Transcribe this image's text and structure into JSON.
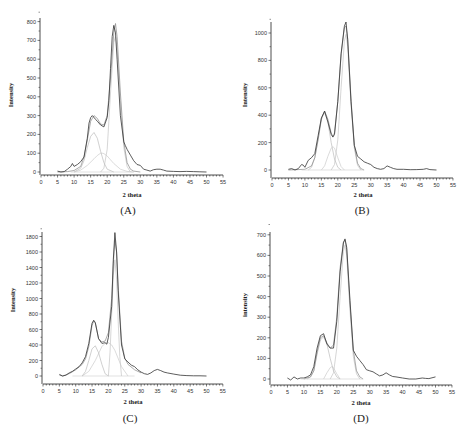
{
  "figure": {
    "panels": [
      "A",
      "B",
      "C",
      "D"
    ]
  },
  "chart_data": [
    {
      "type": "line",
      "panel_label": "(A)",
      "title": "",
      "xlabel": "2 theta",
      "ylabel": "Intensity",
      "xlim": [
        0,
        55
      ],
      "ylim": [
        -20,
        810
      ],
      "xticks": [
        0,
        5,
        10,
        15,
        20,
        25,
        30,
        35,
        40,
        45,
        50,
        55
      ],
      "yticks": [
        0,
        100,
        200,
        300,
        400,
        500,
        600,
        700,
        800
      ],
      "grid": false,
      "legend": null,
      "series": [
        {
          "name": "experimental",
          "color": "#333333",
          "x": [
            5,
            6,
            7,
            8,
            9,
            9.5,
            10,
            11,
            12,
            13,
            14,
            14.5,
            15,
            15.5,
            16,
            16.5,
            17,
            18,
            19,
            20,
            20.5,
            21,
            21.5,
            22,
            22.5,
            23,
            24,
            25,
            25.5,
            26,
            27,
            28,
            29,
            30,
            31,
            32,
            33,
            34,
            35,
            36,
            37,
            38,
            40,
            42,
            44,
            46,
            48,
            50
          ],
          "y": [
            5,
            0,
            2,
            15,
            30,
            45,
            30,
            40,
            55,
            80,
            180,
            260,
            290,
            300,
            290,
            280,
            270,
            250,
            240,
            290,
            380,
            550,
            720,
            780,
            740,
            600,
            300,
            160,
            140,
            120,
            90,
            60,
            40,
            35,
            15,
            10,
            5,
            12,
            15,
            15,
            10,
            5,
            3,
            2,
            3,
            2,
            1,
            0
          ]
        },
        {
          "name": "fit",
          "color": "#888888",
          "x": [
            5,
            8,
            10,
            12,
            13,
            14,
            15,
            16,
            17,
            18,
            19,
            20,
            21,
            22,
            22.5,
            23,
            24,
            25,
            26,
            27,
            28,
            30
          ],
          "y": [
            0,
            2,
            8,
            30,
            80,
            170,
            270,
            300,
            285,
            255,
            250,
            300,
            500,
            740,
            790,
            720,
            420,
            160,
            50,
            15,
            5,
            0
          ]
        },
        {
          "name": "component peak 1 (~16)",
          "color": "#bbbbbb",
          "x": [
            10,
            12,
            13,
            14,
            15,
            16,
            17,
            18,
            19,
            20,
            22
          ],
          "y": [
            0,
            20,
            60,
            130,
            190,
            210,
            180,
            110,
            50,
            15,
            0
          ]
        },
        {
          "name": "component peak 2 (~18.5)",
          "color": "#cccccc",
          "x": [
            10,
            12,
            14,
            16,
            17,
            18,
            18.5,
            19,
            20,
            21,
            22,
            24,
            26,
            28
          ],
          "y": [
            0,
            10,
            35,
            70,
            88,
            100,
            100,
            98,
            85,
            65,
            45,
            15,
            3,
            0
          ]
        },
        {
          "name": "component peak 3 (~22.5)",
          "color": "#c4c4c4",
          "x": [
            18,
            19,
            20,
            21,
            22,
            22.5,
            23,
            24,
            25,
            26,
            27
          ],
          "y": [
            0,
            20,
            120,
            420,
            690,
            720,
            660,
            380,
            130,
            30,
            0
          ]
        }
      ]
    },
    {
      "type": "line",
      "panel_label": "(B)",
      "title": "",
      "xlabel": "2 theta",
      "ylabel": "Intensity",
      "xlim": [
        0,
        55
      ],
      "ylim": [
        -40,
        1090
      ],
      "xticks": [
        0,
        5,
        10,
        15,
        20,
        25,
        30,
        35,
        40,
        45,
        50,
        55
      ],
      "yticks": [
        0,
        200,
        400,
        600,
        800,
        1000
      ],
      "grid": false,
      "legend": null,
      "series": [
        {
          "name": "experimental",
          "color": "#333333",
          "x": [
            5,
            6,
            7,
            8,
            9,
            9.5,
            10,
            11,
            12,
            13,
            14,
            15,
            16,
            17,
            18,
            18.5,
            19,
            20,
            21,
            22,
            22.5,
            23,
            24,
            25,
            26,
            27,
            28,
            29,
            30,
            31,
            32,
            33,
            34,
            35,
            36,
            37,
            38,
            40,
            42,
            44,
            46,
            47,
            48,
            50
          ],
          "y": [
            5,
            10,
            0,
            10,
            40,
            35,
            20,
            70,
            90,
            120,
            250,
            380,
            430,
            350,
            260,
            240,
            260,
            500,
            850,
            1050,
            1080,
            950,
            500,
            180,
            100,
            80,
            60,
            50,
            40,
            20,
            10,
            5,
            10,
            30,
            20,
            10,
            5,
            5,
            2,
            3,
            5,
            10,
            3,
            0
          ]
        },
        {
          "name": "fit",
          "color": "#888888",
          "x": [
            5,
            10,
            12,
            13,
            14,
            15,
            16,
            17,
            18,
            18.5,
            19,
            20,
            21,
            22,
            22.5,
            23,
            24,
            25,
            26,
            27,
            28
          ],
          "y": [
            0,
            5,
            30,
            90,
            220,
            370,
            430,
            370,
            270,
            245,
            270,
            500,
            840,
            1040,
            1050,
            960,
            520,
            180,
            50,
            10,
            0
          ]
        },
        {
          "name": "component peak 1 (~16)",
          "color": "#bbbbbb",
          "x": [
            11,
            12,
            13,
            14,
            15,
            16,
            17,
            18,
            19,
            20,
            21
          ],
          "y": [
            0,
            20,
            90,
            230,
            380,
            420,
            350,
            200,
            80,
            20,
            0
          ]
        },
        {
          "name": "component peak 2 (~18.5)",
          "color": "#cccccc",
          "x": [
            15,
            16,
            17,
            18,
            18.5,
            19,
            20,
            21,
            22
          ],
          "y": [
            0,
            30,
            100,
            160,
            170,
            160,
            90,
            25,
            0
          ]
        },
        {
          "name": "component peak 3 (~22.5)",
          "color": "#c4c4c4",
          "x": [
            18,
            19,
            20,
            21,
            22,
            22.5,
            23,
            24,
            25,
            26,
            27
          ],
          "y": [
            0,
            40,
            220,
            600,
            940,
            990,
            900,
            480,
            160,
            35,
            0
          ]
        }
      ]
    },
    {
      "type": "line",
      "panel_label": "(C)",
      "title": "",
      "xlabel": "2 theta",
      "ylabel": "Intensity",
      "xlim": [
        0,
        55
      ],
      "ylim": [
        -80,
        1870
      ],
      "xticks": [
        0,
        5,
        10,
        15,
        20,
        25,
        30,
        35,
        40,
        45,
        50,
        55
      ],
      "yticks": [
        0,
        200,
        400,
        600,
        800,
        1000,
        1200,
        1400,
        1600,
        1800
      ],
      "grid": false,
      "legend": null,
      "series": [
        {
          "name": "experimental",
          "color": "#333333",
          "x": [
            5,
            6,
            7,
            8,
            9,
            10,
            11,
            12,
            13,
            14,
            15,
            15.5,
            16,
            17,
            18,
            19,
            19.5,
            20,
            21,
            21.5,
            22,
            22.5,
            23,
            24,
            25,
            26,
            27,
            28,
            29,
            30,
            31,
            32,
            33,
            34,
            35,
            36,
            37,
            38,
            40,
            42,
            44,
            46,
            48,
            50
          ],
          "y": [
            20,
            0,
            10,
            40,
            60,
            90,
            120,
            170,
            250,
            420,
            680,
            720,
            690,
            480,
            420,
            430,
            410,
            500,
            900,
            1500,
            1850,
            1600,
            1100,
            400,
            220,
            180,
            140,
            120,
            80,
            50,
            30,
            20,
            40,
            70,
            85,
            70,
            50,
            40,
            25,
            10,
            5,
            3,
            2,
            0
          ]
        },
        {
          "name": "fit",
          "color": "#888888",
          "x": [
            5,
            6,
            8,
            10,
            12,
            13,
            14,
            15,
            15.5,
            16,
            17,
            18,
            19,
            20,
            21,
            21.5,
            22,
            22.5,
            23,
            24,
            25,
            26,
            28,
            30
          ],
          "y": [
            10,
            0,
            30,
            80,
            150,
            220,
            380,
            650,
            710,
            680,
            480,
            440,
            450,
            560,
            1000,
            1450,
            1750,
            1600,
            1150,
            450,
            230,
            150,
            80,
            40
          ]
        },
        {
          "name": "component peak 1 (~16)",
          "color": "#bbbbbb",
          "x": [
            12,
            13,
            14,
            15,
            16,
            17,
            18,
            19,
            20
          ],
          "y": [
            0,
            60,
            200,
            350,
            390,
            300,
            150,
            30,
            0
          ]
        },
        {
          "name": "component peak 2 (~20, broad)",
          "color": "#cccccc",
          "x": [
            12,
            14,
            16,
            18,
            19,
            20,
            21,
            22,
            24,
            26
          ],
          "y": [
            0,
            60,
            200,
            380,
            420,
            430,
            400,
            330,
            120,
            0
          ]
        },
        {
          "name": "component peak 3 (~22)",
          "color": "#c4c4c4",
          "x": [
            20,
            20.5,
            21,
            21.5,
            22,
            22.5,
            23,
            23.5,
            24
          ],
          "y": [
            0,
            300,
            800,
            1300,
            1500,
            1250,
            700,
            250,
            0
          ]
        }
      ]
    },
    {
      "type": "line",
      "panel_label": "(D)",
      "title": "",
      "xlabel": "2 theta",
      "ylabel": "intensity",
      "xlim": [
        0,
        55
      ],
      "ylim": [
        -20,
        710
      ],
      "xticks": [
        0,
        5,
        10,
        15,
        20,
        25,
        30,
        35,
        40,
        45,
        50,
        55
      ],
      "yticks": [
        0,
        100,
        200,
        300,
        400,
        500,
        600,
        700
      ],
      "grid": false,
      "legend": null,
      "series": [
        {
          "name": "experimental",
          "color": "#333333",
          "x": [
            5,
            6,
            7,
            8,
            9,
            10,
            11,
            12,
            13,
            14,
            15,
            16,
            17,
            18,
            19,
            20,
            21,
            22,
            22.5,
            23,
            24,
            25,
            26,
            27,
            28,
            29,
            30,
            31,
            32,
            33,
            34,
            35,
            36,
            37,
            38,
            40,
            42,
            44,
            46,
            47,
            48,
            50
          ],
          "y": [
            5,
            -5,
            10,
            0,
            5,
            5,
            10,
            20,
            60,
            150,
            210,
            220,
            170,
            150,
            150,
            280,
            520,
            660,
            680,
            640,
            380,
            140,
            110,
            90,
            70,
            45,
            40,
            35,
            25,
            15,
            20,
            30,
            20,
            12,
            10,
            5,
            0,
            0,
            5,
            3,
            2,
            10
          ]
        },
        {
          "name": "fit",
          "color": "#888888",
          "x": [
            10,
            12,
            13,
            14,
            15,
            16,
            17,
            18,
            19,
            20,
            21,
            22,
            22.5,
            23,
            24,
            25,
            26,
            27,
            28
          ],
          "y": [
            0,
            10,
            40,
            130,
            200,
            210,
            175,
            150,
            165,
            300,
            540,
            665,
            675,
            630,
            360,
            140,
            40,
            10,
            0
          ]
        },
        {
          "name": "component peak 1 (~16)",
          "color": "#bbbbbb",
          "x": [
            11,
            12,
            13,
            14,
            15,
            16,
            17,
            18,
            19,
            20,
            21
          ],
          "y": [
            0,
            10,
            40,
            120,
            190,
            205,
            170,
            100,
            40,
            10,
            0
          ]
        },
        {
          "name": "component peak 2 (~18.5)",
          "color": "#cccccc",
          "x": [
            16,
            17,
            18,
            18.5,
            19,
            20,
            21
          ],
          "y": [
            0,
            30,
            55,
            60,
            55,
            25,
            0
          ]
        },
        {
          "name": "component peak 3 (~22.5)",
          "color": "#c4c4c4",
          "x": [
            18,
            19,
            20,
            21,
            22,
            22.5,
            23,
            24,
            25,
            26,
            27
          ],
          "y": [
            0,
            30,
            150,
            400,
            620,
            650,
            600,
            330,
            110,
            25,
            0
          ]
        }
      ]
    }
  ],
  "layout": {
    "panels": [
      {
        "id": "A",
        "plot": {
          "x0": 41,
          "y_zero": 172,
          "x_per_unit": 3.31,
          "y_per_unit": 0.188,
          "axis_y": 175,
          "y_top": 18
        },
        "xlabel_pos": [
          132,
          197
        ],
        "ylabel_pos": [
          13,
          95
        ],
        "panel_label_pos": [
          128,
          214
        ]
      },
      {
        "id": "B",
        "plot": {
          "x0": 272,
          "y_zero": 170,
          "x_per_unit": 3.29,
          "y_per_unit": 0.137,
          "axis_y": 178,
          "y_top": 22
        },
        "xlabel_pos": [
          363,
          197
        ],
        "ylabel_pos": [
          247,
          95
        ],
        "panel_label_pos": [
          362,
          214
        ]
      },
      {
        "id": "C",
        "plot": {
          "x0": 43,
          "y_zero": 376,
          "x_per_unit": 3.27,
          "y_per_unit": 0.0775,
          "axis_y": 384,
          "y_top": 232
        },
        "xlabel_pos": [
          133,
          404
        ],
        "ylabel_pos": [
          15,
          300
        ],
        "panel_label_pos": [
          130,
          422
        ]
      },
      {
        "id": "D",
        "plot": {
          "x0": 271,
          "y_zero": 379,
          "x_per_unit": 3.29,
          "y_per_unit": 0.206,
          "axis_y": 385,
          "y_top": 232
        },
        "xlabel_pos": [
          361,
          405
        ],
        "ylabel_pos": [
          247,
          305
        ],
        "panel_label_pos": [
          361,
          422
        ]
      }
    ]
  }
}
